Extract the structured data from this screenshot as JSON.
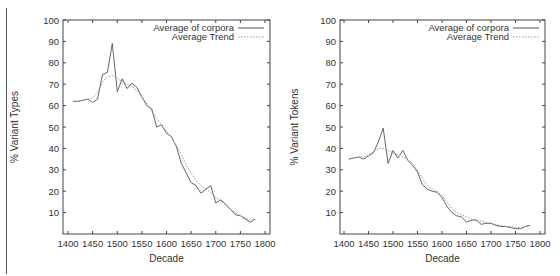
{
  "chart_data": [
    {
      "type": "line",
      "title": "",
      "xlabel": "Decade",
      "ylabel": "% Variant Types",
      "xlim": [
        1390,
        1810
      ],
      "ylim": [
        0,
        100
      ],
      "xticks": [
        1400,
        1450,
        1500,
        1550,
        1600,
        1650,
        1700,
        1750,
        1800
      ],
      "yticks": [
        10,
        20,
        30,
        40,
        50,
        60,
        70,
        80,
        90,
        100
      ],
      "grid": false,
      "legend_position": "top-right",
      "x": [
        1410,
        1420,
        1430,
        1440,
        1450,
        1460,
        1470,
        1480,
        1490,
        1500,
        1510,
        1520,
        1530,
        1540,
        1550,
        1560,
        1570,
        1580,
        1590,
        1600,
        1610,
        1620,
        1630,
        1640,
        1650,
        1660,
        1670,
        1680,
        1690,
        1700,
        1710,
        1720,
        1730,
        1740,
        1750,
        1760,
        1770,
        1780
      ],
      "series": [
        {
          "name": "Average of corpora",
          "style": "solid",
          "values": [
            62,
            62,
            62.5,
            63,
            61.5,
            63,
            74.5,
            75.5,
            89,
            66.5,
            72.5,
            68,
            70.5,
            68.5,
            64,
            60,
            58.5,
            50,
            51,
            47,
            45.5,
            41,
            33,
            28.5,
            24,
            22.5,
            19,
            21,
            22.5,
            14.5,
            16,
            14,
            11.5,
            9,
            8.5,
            7,
            5.5,
            7
          ]
        },
        {
          "name": "Average Trend",
          "style": "dotted",
          "values": [
            62,
            62,
            62.5,
            63,
            63.5,
            66,
            71,
            73.5,
            74,
            73,
            71,
            70,
            69,
            67,
            64,
            61,
            57.5,
            54,
            51,
            48,
            45,
            41.5,
            37,
            32.5,
            28.5,
            25,
            22.5,
            21,
            19.5,
            17,
            15.5,
            13.5,
            11.5,
            10,
            8.5,
            7.5,
            6.5,
            6.5
          ]
        }
      ]
    },
    {
      "type": "line",
      "title": "",
      "xlabel": "Decade",
      "ylabel": "% Variant Tokens",
      "xlim": [
        1390,
        1810
      ],
      "ylim": [
        0,
        100
      ],
      "xticks": [
        1400,
        1450,
        1500,
        1550,
        1600,
        1650,
        1700,
        1750,
        1800
      ],
      "yticks": [
        10,
        20,
        30,
        40,
        50,
        60,
        70,
        80,
        90,
        100
      ],
      "grid": false,
      "legend_position": "top-right",
      "x": [
        1410,
        1420,
        1430,
        1440,
        1450,
        1460,
        1470,
        1480,
        1490,
        1500,
        1510,
        1520,
        1530,
        1540,
        1550,
        1560,
        1570,
        1580,
        1590,
        1600,
        1610,
        1620,
        1630,
        1640,
        1650,
        1660,
        1670,
        1680,
        1690,
        1700,
        1710,
        1720,
        1730,
        1740,
        1750,
        1760,
        1770,
        1780
      ],
      "series": [
        {
          "name": "Average of corpora",
          "style": "solid",
          "values": [
            35,
            35.5,
            36,
            35,
            36.5,
            38,
            43,
            49.5,
            33,
            39,
            35.5,
            39,
            34.5,
            32,
            29,
            23,
            21,
            20,
            19.5,
            17,
            13,
            10,
            8.5,
            8,
            5.5,
            6.5,
            6.5,
            4.5,
            5,
            5,
            4,
            3.5,
            3.5,
            3,
            2.5,
            2.5,
            3.5,
            4
          ]
        },
        {
          "name": "Average Trend",
          "style": "dotted",
          "values": [
            35,
            35.5,
            36,
            36,
            37,
            38.5,
            40,
            40,
            39,
            38,
            37,
            36,
            35,
            33,
            30,
            26,
            22.5,
            21,
            20,
            18,
            15,
            12,
            10,
            9,
            8,
            7,
            6.5,
            6,
            5.5,
            5,
            4.5,
            4,
            3.5,
            3.5,
            3,
            3,
            3.5,
            4
          ]
        }
      ]
    }
  ],
  "charts": [
    {
      "ylabel": "% Variant Types",
      "xlabel": "Decade",
      "legend": [
        "Average of corpora",
        "Average Trend"
      ]
    },
    {
      "ylabel": "% Variant Tokens",
      "xlabel": "Decade",
      "legend": [
        "Average of corpora",
        "Average Trend"
      ]
    }
  ],
  "colors": {
    "series_line": "#555555",
    "trend_line": "#999999",
    "axis": "#444444",
    "text": "#333333"
  }
}
